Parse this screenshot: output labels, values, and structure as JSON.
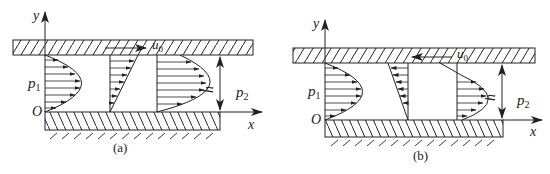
{
  "figure": {
    "panels": [
      {
        "id": "a",
        "caption": "(a)",
        "axis_y": "y",
        "axis_x": "x",
        "origin": "O",
        "pressure_left": "p",
        "pressure_left_sub": "1",
        "pressure_right": "p",
        "pressure_right_sub": "2",
        "gap": "h",
        "plate_velocity": "u",
        "plate_velocity_sub": "0",
        "plate_direction": "right"
      },
      {
        "id": "b",
        "caption": "(b)",
        "axis_y": "y",
        "axis_x": "x",
        "origin": "O",
        "pressure_left": "p",
        "pressure_left_sub": "1",
        "pressure_right": "p",
        "pressure_right_sub": "2",
        "gap": "h",
        "plate_velocity": "u",
        "plate_velocity_sub": "0",
        "plate_direction": "left"
      }
    ]
  },
  "colors": {
    "line": "#222222",
    "background": "#ffffff"
  }
}
